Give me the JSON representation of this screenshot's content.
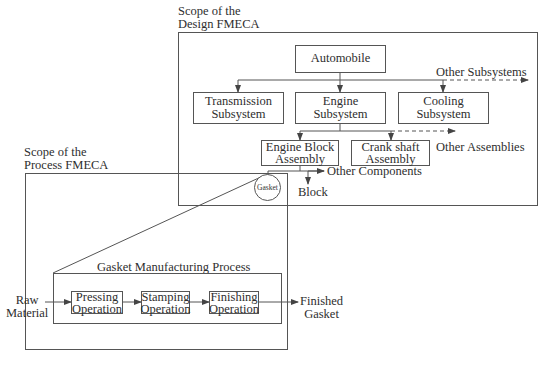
{
  "design_scope": {
    "title_line1": "Scope of the",
    "title_line2": "Design FMECA",
    "root": "Automobile",
    "subsystems": [
      {
        "line1": "Transmission",
        "line2": "Subsystem"
      },
      {
        "line1": "Engine",
        "line2": "Subsystem"
      },
      {
        "line1": "Cooling",
        "line2": "Subsystem"
      }
    ],
    "other_subsystems": "Other Subsystems",
    "assemblies": [
      {
        "line1": "Engine Block",
        "line2": "Assembly"
      },
      {
        "line1": "Crank shaft",
        "line2": "Assembly"
      }
    ],
    "other_assemblies": "Other Assemblies",
    "other_components": "Other Components",
    "block": "Block",
    "gasket": "Gasket"
  },
  "process_scope": {
    "title_line1": "Scope of the",
    "title_line2": "Process FMECA",
    "process_title": "Gasket Manufacturing Process",
    "input_line1": "Raw",
    "input_line2": "Material",
    "operations": [
      {
        "line1": "Pressing",
        "line2": "Operation"
      },
      {
        "line1": "Stamping",
        "line2": "Operation"
      },
      {
        "line1": "Finishing",
        "line2": "Operation"
      }
    ],
    "output_line1": "Finished",
    "output_line2": "Gasket"
  },
  "colors": {
    "line": "#555555",
    "text": "#2e2e2e",
    "background": "#ffffff"
  }
}
